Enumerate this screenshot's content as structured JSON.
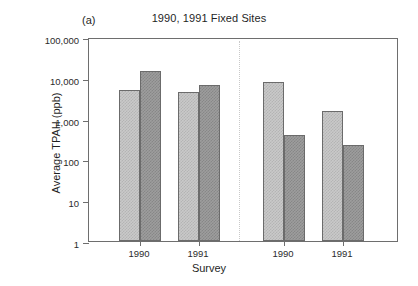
{
  "panel_label": "(a)",
  "chart_data": {
    "type": "bar",
    "title": "1990, 1991 Fixed Sites",
    "xlabel": "Survey",
    "ylabel": "Average TPAH (ppb)",
    "yscale": "log",
    "ylim": [
      1,
      100000
    ],
    "ytick_labels": [
      "1",
      "10",
      "100",
      "1,000",
      "10,000",
      "100,000"
    ],
    "ytick_values": [
      1,
      10,
      100,
      1000,
      10000,
      100000
    ],
    "grid": false,
    "legend": "none",
    "groups": [
      "Boulder/Cobble",
      "Pebble/Gravel"
    ],
    "categories": [
      "1990",
      "1991",
      "1990",
      "1991"
    ],
    "series": [
      {
        "name": "light",
        "values": [
          5000,
          4500,
          8000,
          1500
        ]
      },
      {
        "name": "dark",
        "values": [
          15000,
          6800,
          390,
          225
        ]
      }
    ],
    "bars": [
      {
        "group": "Boulder/Cobble",
        "survey": "1990",
        "shade": "light",
        "value": 5000
      },
      {
        "group": "Boulder/Cobble",
        "survey": "1990",
        "shade": "dark",
        "value": 15000
      },
      {
        "group": "Boulder/Cobble",
        "survey": "1991",
        "shade": "light",
        "value": 4500
      },
      {
        "group": "Boulder/Cobble",
        "survey": "1991",
        "shade": "dark",
        "value": 6800
      },
      {
        "group": "Pebble/Gravel",
        "survey": "1990",
        "shade": "light",
        "value": 8000
      },
      {
        "group": "Pebble/Gravel",
        "survey": "1990",
        "shade": "dark",
        "value": 390
      },
      {
        "group": "Pebble/Gravel",
        "survey": "1991",
        "shade": "light",
        "value": 1500
      },
      {
        "group": "Pebble/Gravel",
        "survey": "1991",
        "shade": "dark",
        "value": 225
      }
    ],
    "colors": {
      "light_bar": "#c9c9c9",
      "dark_bar": "#9d9d9d",
      "axis": "#6e6e6e",
      "text": "#1f1f1f",
      "background": "#ffffff"
    }
  }
}
